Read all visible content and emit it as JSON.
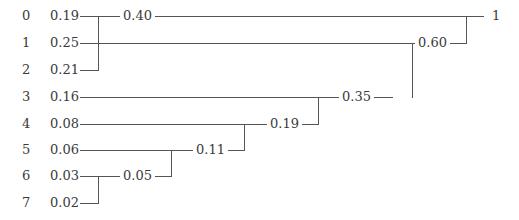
{
  "diagram": {
    "type": "huffman-tree",
    "leaves": [
      {
        "index": "0",
        "prob": "0.19"
      },
      {
        "index": "1",
        "prob": "0.25"
      },
      {
        "index": "2",
        "prob": "0.21"
      },
      {
        "index": "3",
        "prob": "0.16"
      },
      {
        "index": "4",
        "prob": "0.08"
      },
      {
        "index": "5",
        "prob": "0.06"
      },
      {
        "index": "6",
        "prob": "0.03"
      },
      {
        "index": "7",
        "prob": "0.02"
      }
    ],
    "merges": [
      {
        "label": "0.05",
        "children": [
          "6",
          "7"
        ]
      },
      {
        "label": "0.11",
        "children": [
          "5",
          "0.05"
        ]
      },
      {
        "label": "0.19",
        "children": [
          "4",
          "0.11"
        ]
      },
      {
        "label": "0.35",
        "children": [
          "3",
          "0.19"
        ]
      },
      {
        "label": "0.40",
        "children": [
          "0",
          "2"
        ]
      },
      {
        "label": "0.60",
        "children": [
          "1",
          "0.35"
        ]
      },
      {
        "label": "1",
        "children": [
          "0.40",
          "0.60"
        ]
      }
    ],
    "line_color": "#555555",
    "text_color": "#3a3a3a"
  }
}
